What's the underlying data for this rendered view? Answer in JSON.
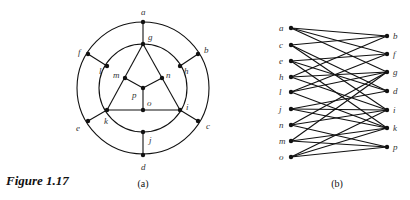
{
  "figure": {
    "caption": "Figure 1.17",
    "panels": [
      {
        "id": "a",
        "label": "(a)",
        "circles": [
          {
            "cx": 143,
            "cy": 88,
            "r": 66
          },
          {
            "cx": 143,
            "cy": 88,
            "r": 44
          }
        ],
        "nodes": [
          {
            "id": "a",
            "x": 143,
            "y": 22,
            "lx": 141,
            "ly": 15
          },
          {
            "id": "b",
            "x": 198,
            "y": 54,
            "lx": 204,
            "ly": 53
          },
          {
            "id": "c",
            "x": 198,
            "y": 121,
            "lx": 206,
            "ly": 129
          },
          {
            "id": "d",
            "x": 143,
            "y": 155,
            "lx": 141,
            "ly": 170
          },
          {
            "id": "e",
            "x": 88,
            "y": 121,
            "lx": 76,
            "ly": 131
          },
          {
            "id": "f",
            "x": 88,
            "y": 54,
            "lx": 78,
            "ly": 55
          },
          {
            "id": "g",
            "x": 143,
            "y": 44,
            "lx": 148,
            "ly": 40
          },
          {
            "id": "h",
            "x": 180,
            "y": 66,
            "lx": 184,
            "ly": 74
          },
          {
            "id": "i",
            "x": 180,
            "y": 110,
            "lx": 186,
            "ly": 110
          },
          {
            "id": "j",
            "x": 143,
            "y": 132,
            "lx": 149,
            "ly": 143
          },
          {
            "id": "k",
            "x": 107,
            "y": 110,
            "lx": 104,
            "ly": 124
          },
          {
            "id": "l",
            "x": 107,
            "y": 66,
            "lx": 99,
            "ly": 74
          },
          {
            "id": "m",
            "x": 125,
            "y": 78,
            "lx": 113,
            "ly": 78
          },
          {
            "id": "n",
            "x": 162,
            "y": 78,
            "lx": 166,
            "ly": 78
          },
          {
            "id": "o",
            "x": 143,
            "y": 110,
            "lx": 147,
            "ly": 106
          },
          {
            "id": "p",
            "x": 143,
            "y": 88,
            "lx": 132,
            "ly": 98
          }
        ],
        "straight_edges": [
          [
            "a",
            "g"
          ],
          [
            "f",
            "l"
          ],
          [
            "b",
            "h"
          ],
          [
            "e",
            "k"
          ],
          [
            "c",
            "i"
          ],
          [
            "d",
            "j"
          ],
          [
            "g",
            "k"
          ],
          [
            "g",
            "i"
          ],
          [
            "k",
            "o"
          ],
          [
            "o",
            "i"
          ],
          [
            "m",
            "p"
          ],
          [
            "n",
            "p"
          ],
          [
            "o",
            "p"
          ]
        ],
        "label_pos": {
          "x": 143,
          "y": 187
        }
      },
      {
        "id": "b",
        "label": "(b)",
        "left_nodes": [
          {
            "id": "a",
            "y": 28
          },
          {
            "id": "c",
            "y": 45
          },
          {
            "id": "e",
            "y": 61
          },
          {
            "id": "h",
            "y": 77
          },
          {
            "id": "l",
            "y": 92
          },
          {
            "id": "j",
            "y": 109
          },
          {
            "id": "n",
            "y": 125
          },
          {
            "id": "m",
            "y": 141
          },
          {
            "id": "o",
            "y": 157
          }
        ],
        "right_nodes": [
          {
            "id": "b",
            "y": 36
          },
          {
            "id": "f",
            "y": 54
          },
          {
            "id": "g",
            "y": 72
          },
          {
            "id": "d",
            "y": 91
          },
          {
            "id": "i",
            "y": 110
          },
          {
            "id": "k",
            "y": 128
          },
          {
            "id": "p",
            "y": 147
          }
        ],
        "left_x": 291,
        "right_x": 387,
        "edges": [
          [
            "a",
            "b"
          ],
          [
            "a",
            "f"
          ],
          [
            "a",
            "g"
          ],
          [
            "c",
            "b"
          ],
          [
            "c",
            "d"
          ],
          [
            "c",
            "i"
          ],
          [
            "e",
            "f"
          ],
          [
            "e",
            "d"
          ],
          [
            "e",
            "k"
          ],
          [
            "h",
            "b"
          ],
          [
            "h",
            "g"
          ],
          [
            "h",
            "i"
          ],
          [
            "l",
            "f"
          ],
          [
            "l",
            "g"
          ],
          [
            "l",
            "k"
          ],
          [
            "j",
            "d"
          ],
          [
            "j",
            "i"
          ],
          [
            "j",
            "k"
          ],
          [
            "n",
            "g"
          ],
          [
            "n",
            "i"
          ],
          [
            "n",
            "p"
          ],
          [
            "m",
            "g"
          ],
          [
            "m",
            "k"
          ],
          [
            "m",
            "p"
          ],
          [
            "o",
            "i"
          ],
          [
            "o",
            "k"
          ],
          [
            "o",
            "p"
          ]
        ],
        "label_pos": {
          "x": 337,
          "y": 187
        }
      }
    ]
  }
}
